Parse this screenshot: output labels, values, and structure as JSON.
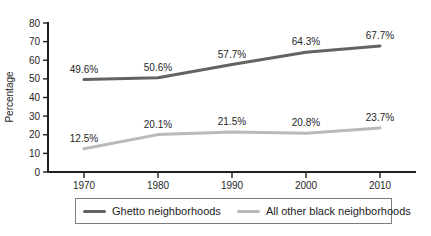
{
  "chart_data": {
    "type": "line",
    "categories": [
      "1970",
      "1980",
      "1990",
      "2000",
      "2010"
    ],
    "series": [
      {
        "name": "Ghetto neighborhoods",
        "values": [
          49.6,
          50.6,
          57.7,
          64.3,
          67.7
        ],
        "labels": [
          "49.6%",
          "50.6%",
          "57.7%",
          "64.3%",
          "67.7%"
        ],
        "color": "#636363"
      },
      {
        "name": "All other black neighborhoods",
        "values": [
          12.5,
          20.1,
          21.5,
          20.8,
          23.7
        ],
        "labels": [
          "12.5%",
          "20.1%",
          "21.5%",
          "20.8%",
          "23.7%"
        ],
        "color": "#b9b9b9"
      }
    ],
    "title": "",
    "xlabel": "",
    "ylabel": "Percentage",
    "ylim": [
      0,
      80
    ],
    "ytick_step": 10,
    "yticks": [
      "0",
      "10",
      "20",
      "30",
      "40",
      "50",
      "60",
      "70",
      "80"
    ],
    "grid": false,
    "legend_position": "bottom",
    "colors": {
      "axis": "#1f1f1f",
      "text": "#262626"
    }
  }
}
